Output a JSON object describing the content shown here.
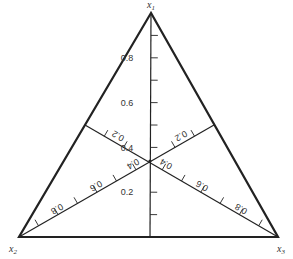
{
  "diagram": {
    "type": "ternary-simplex-coordinate-diagram",
    "colors": {
      "line": "#222222",
      "text": "#333333",
      "background": "#ffffff"
    },
    "vertices": [
      {
        "id": "x1",
        "label": "x",
        "sub": "1",
        "x": 151,
        "y": 13,
        "lx": 147,
        "ly": 8
      },
      {
        "id": "x2",
        "label": "x",
        "sub": "2",
        "x": 19,
        "y": 237,
        "lx": 9,
        "ly": 252
      },
      {
        "id": "x3",
        "label": "x",
        "sub": "3",
        "x": 278,
        "y": 237,
        "lx": 277,
        "ly": 252
      }
    ],
    "medians": [
      {
        "name": "x1-axis",
        "from": [
          151,
          13
        ],
        "to": [
          150,
          237
        ]
      },
      {
        "name": "x2-axis",
        "from": [
          19,
          237
        ],
        "to": [
          214,
          125
        ]
      },
      {
        "name": "x3-axis",
        "from": [
          278,
          237
        ],
        "to": [
          85,
          125
        ]
      }
    ],
    "centroid": {
      "x": 150,
      "y": 161
    },
    "axes": {
      "x1": {
        "ticks": [
          0.1,
          0.2,
          0.3,
          0.4,
          0.5,
          0.6,
          0.7,
          0.8,
          0.9
        ],
        "labels": [
          {
            "text": "0.2",
            "x": 127,
            "y": 195,
            "rot": 0
          },
          {
            "text": "0.4",
            "x": 127,
            "y": 151,
            "rot": 0
          },
          {
            "text": "0.6",
            "x": 127,
            "y": 106,
            "rot": 0
          },
          {
            "text": "0.8",
            "x": 127,
            "y": 61,
            "rot": 0
          }
        ]
      },
      "x2": {
        "labels": [
          {
            "text": "0.2",
            "x": 181,
            "y": 139,
            "rot": 150
          },
          {
            "text": "0.4",
            "x": 133,
            "y": 167,
            "rot": 150
          },
          {
            "text": "0.6",
            "x": 96,
            "y": 189,
            "rot": 150
          },
          {
            "text": "0.8",
            "x": 57,
            "y": 212,
            "rot": 150
          }
        ]
      },
      "x3": {
        "labels": [
          {
            "text": "0.2",
            "x": 118,
            "y": 139,
            "rot": 210
          },
          {
            "text": "0.4",
            "x": 166,
            "y": 167,
            "rot": 210
          },
          {
            "text": "0.6",
            "x": 202,
            "y": 189,
            "rot": 210
          },
          {
            "text": "0.8",
            "x": 241,
            "y": 212,
            "rot": 210
          }
        ]
      }
    }
  }
}
